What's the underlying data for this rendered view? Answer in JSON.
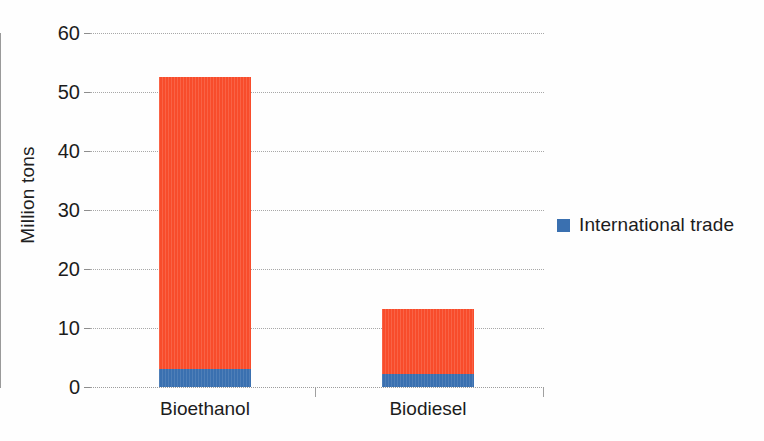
{
  "chart_data": {
    "type": "bar",
    "subtype": "stacked-column",
    "title": "",
    "subtitle": "",
    "xlabel": "",
    "ylabel": "Million tons",
    "categories": [
      "Bioethanol",
      "Biodiesel"
    ],
    "ylim": [
      0,
      60
    ],
    "yticks": [
      0,
      10,
      20,
      30,
      40,
      50,
      60
    ],
    "ytick_labels": [
      "0",
      "10",
      "20",
      "30",
      "40",
      "50",
      "60"
    ],
    "grid": true,
    "grid_axis": "y",
    "grid_style": "dotted",
    "legend_position": "right",
    "series": [
      {
        "name": "International trade",
        "color": "#3a70b0",
        "values": [
          3.0,
          2.2
        ],
        "in_legend": true
      },
      {
        "name": "",
        "color": "#f84c2b",
        "values": [
          49.5,
          11.0
        ],
        "in_legend": false
      }
    ],
    "totals": [
      52.5,
      13.2
    ],
    "annotations": []
  },
  "legend": {
    "entries": [
      {
        "label": "International trade",
        "color": "#3a70b0"
      }
    ]
  },
  "colors": {
    "series_trade": "#3a70b0",
    "series_other": "#f84c2b",
    "gridline": "#a8a8a8",
    "axis": "#9a9a9a",
    "text": "#1c1c1c",
    "background": "#fefefe"
  }
}
